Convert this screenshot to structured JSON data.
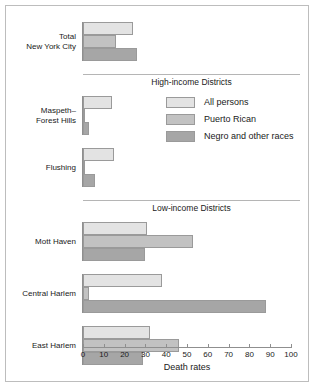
{
  "chart_data": {
    "type": "bar",
    "orientation": "horizontal",
    "title": "",
    "xlabel": "Death rates",
    "ylabel": "",
    "xlim": [
      0,
      100
    ],
    "xticks": [
      0,
      10,
      20,
      30,
      40,
      50,
      60,
      70,
      80,
      90,
      100
    ],
    "grid": false,
    "legend_position": "inside-upper-right",
    "series": [
      {
        "name": "All persons",
        "color": "#e3e3e3"
      },
      {
        "name": "Puerto Rican",
        "color": "#c2c2c2"
      },
      {
        "name": "Negro and other races",
        "color": "#a6a6a6"
      }
    ],
    "sections": [
      {
        "caption": "",
        "categories": [
          {
            "label": "Total\nNew York City",
            "values": [
              24,
              16,
              26
            ]
          }
        ]
      },
      {
        "caption": "High-income Districts",
        "categories": [
          {
            "label": "Maspeth–\nForest Hills",
            "values": [
              14,
              1,
              3
            ]
          },
          {
            "label": "Flushing",
            "values": [
              15,
              1,
              6
            ]
          }
        ]
      },
      {
        "caption": "Low-income Districts",
        "categories": [
          {
            "label": "Mott Haven",
            "values": [
              31,
              53,
              30
            ]
          },
          {
            "label": "Central Harlem",
            "values": [
              38,
              3,
              88
            ]
          },
          {
            "label": "East Harlem",
            "values": [
              32,
              46,
              29
            ]
          }
        ]
      }
    ]
  }
}
